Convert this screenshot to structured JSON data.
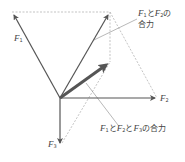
{
  "diagram": {
    "origin": [
      60,
      98
    ],
    "vectors": [
      {
        "id": "F1",
        "label": "F",
        "sub": "1",
        "from": [
          60,
          98
        ],
        "to": [
          12,
          12
        ]
      },
      {
        "id": "F2",
        "label": "F",
        "sub": "2",
        "from": [
          60,
          98
        ],
        "to": [
          157,
          98
        ]
      },
      {
        "id": "F3",
        "label": "F",
        "sub": "3",
        "from": [
          60,
          98
        ],
        "to": [
          60,
          145
        ]
      },
      {
        "id": "F12",
        "label": "F1とF2の合力",
        "from": [
          60,
          98
        ],
        "to": [
          110,
          12
        ]
      },
      {
        "id": "F123",
        "label": "F1とF2とF3の合力",
        "from": [
          60,
          98
        ],
        "to": [
          110,
          62
        ],
        "thick": true
      }
    ],
    "dashed_lines": [
      {
        "from": [
          12,
          12
        ],
        "to": [
          110,
          12
        ]
      },
      {
        "from": [
          110,
          12
        ],
        "to": [
          157,
          98
        ]
      },
      {
        "from": [
          110,
          12
        ],
        "to": [
          110,
          62
        ]
      },
      {
        "from": [
          60,
          145
        ],
        "to": [
          110,
          62
        ]
      }
    ],
    "labels": {
      "f1": {
        "main": "F",
        "sub": "1"
      },
      "f2": {
        "main": "F",
        "sub": "2"
      },
      "f3": {
        "main": "F",
        "sub": "3"
      },
      "resultant12_line1_a": "F",
      "resultant12_line1_sub1": "1",
      "resultant12_line1_to": "と",
      "resultant12_line1_b": "F",
      "resultant12_line1_sub2": "2",
      "resultant12_line1_no": "の",
      "resultant12_line2": "合力",
      "resultant123_a": "F",
      "resultant123_sub1": "1",
      "resultant123_to1": "と",
      "resultant123_b": "F",
      "resultant123_sub2": "2",
      "resultant123_to2": "と",
      "resultant123_c": "F",
      "resultant123_sub3": "3",
      "resultant123_tail": "の合力"
    },
    "colors": {
      "vector": "#555555",
      "dashed": "#aaaaaa",
      "leader": "#888888",
      "text": "#444444"
    }
  }
}
